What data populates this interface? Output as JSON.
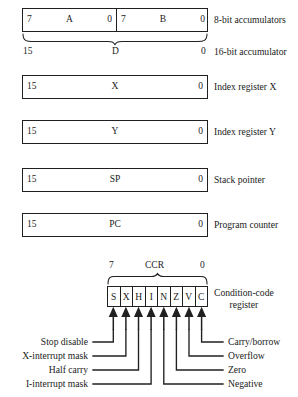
{
  "registers": [
    {
      "id": "accumulators",
      "kind": "split",
      "left": {
        "msb": "7",
        "name": "A",
        "lsb": "0"
      },
      "right": {
        "msb": "7",
        "name": "B",
        "lsb": "0"
      },
      "description": "8-bit accumulators"
    },
    {
      "id": "accumulator-d",
      "kind": "brace",
      "msb": "15",
      "name": "D",
      "lsb": "0",
      "description": "16-bit accumulator"
    },
    {
      "id": "index-register-x",
      "kind": "single",
      "msb": "15",
      "name": "X",
      "lsb": "0",
      "description": "Index register X"
    },
    {
      "id": "index-register-y",
      "kind": "single",
      "msb": "15",
      "name": "Y",
      "lsb": "0",
      "description": "Index register Y"
    },
    {
      "id": "stack-pointer",
      "kind": "single",
      "msb": "15",
      "name": "SP",
      "lsb": "0",
      "description": "Stack pointer"
    },
    {
      "id": "program-counter",
      "kind": "single",
      "msb": "15",
      "name": "PC",
      "lsb": "0",
      "description": "Program counter"
    }
  ],
  "ccr": {
    "msb": "7",
    "name": "CCR",
    "lsb": "0",
    "description_line1": "Condition-code",
    "description_line2": "register",
    "bits": [
      {
        "symbol": "S",
        "label": "Stop disable",
        "side": "left"
      },
      {
        "symbol": "X",
        "label": "X-interrupt mask",
        "side": "left"
      },
      {
        "symbol": "H",
        "label": "Half carry",
        "side": "left"
      },
      {
        "symbol": "I",
        "label": "I-interrupt mask",
        "side": "left"
      },
      {
        "symbol": "N",
        "label": "Negative",
        "side": "right"
      },
      {
        "symbol": "Z",
        "label": "Zero",
        "side": "right"
      },
      {
        "symbol": "V",
        "label": "Overflow",
        "side": "right"
      },
      {
        "symbol": "C",
        "label": "Carry/borrow",
        "side": "right"
      }
    ]
  },
  "colors": {
    "ink": "#202020",
    "background": "#ffffff"
  }
}
